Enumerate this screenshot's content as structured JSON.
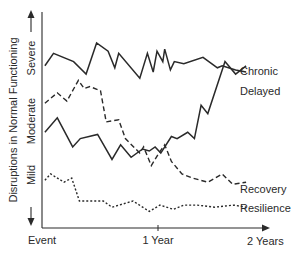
{
  "chart_data": {
    "type": "line",
    "title": "",
    "xlabel": "",
    "ylabel": "Disruptions in Normal Functioning",
    "x_ticks": [
      {
        "label": "Event",
        "value": 0
      },
      {
        "label": "1 Year",
        "value": 12
      },
      {
        "label": "2 Years",
        "value": 24
      }
    ],
    "y_levels": [
      {
        "label": "Mild",
        "value": 2.5
      },
      {
        "label": "Moderate",
        "value": 5.5
      },
      {
        "label": "Severe",
        "value": 8.5
      }
    ],
    "xlim": [
      0,
      24
    ],
    "ylim": [
      0,
      10
    ],
    "grid": false,
    "legend_position": "inline-right",
    "series": [
      {
        "name": "Chronic",
        "style": "solid",
        "x": [
          0.3,
          1.2,
          3.3,
          4.6,
          5.7,
          6.9,
          7.6,
          8.0,
          10.2,
          11.0,
          11.6,
          12.0,
          12.6,
          12.8,
          13.4,
          13.8,
          14.8,
          16.8,
          18.3,
          18.8,
          20.2,
          21.3
        ],
        "values": [
          7.8,
          8.4,
          8.0,
          7.4,
          8.9,
          8.5,
          7.7,
          8.4,
          7.2,
          8.4,
          7.5,
          8.5,
          8.0,
          8.6,
          7.6,
          8.0,
          7.9,
          8.2,
          7.7,
          7.8,
          7.6,
          7.5
        ]
      },
      {
        "name": "Delayed",
        "style": "solid",
        "x": [
          0.3,
          1.6,
          3.2,
          4.0,
          5.8,
          7.3,
          8.2,
          9.3,
          10.5,
          11.2,
          11.8,
          12.4,
          13.5,
          14.1,
          15.2,
          15.9,
          16.6,
          17.3,
          19.1,
          20.2,
          21.3
        ],
        "values": [
          4.6,
          5.3,
          3.9,
          4.3,
          4.5,
          3.3,
          4.0,
          3.4,
          3.8,
          3.7,
          3.9,
          3.6,
          4.4,
          4.3,
          4.6,
          4.3,
          5.9,
          5.5,
          8.0,
          7.4,
          7.8
        ]
      },
      {
        "name": "Recovery",
        "style": "dashed",
        "x": [
          0.3,
          1.6,
          2.6,
          3.8,
          4.4,
          5.0,
          6.1,
          6.7,
          8.0,
          8.7,
          10.2,
          10.6,
          11.4,
          12.2,
          12.8,
          13.5,
          14.6,
          15.7,
          17.3,
          18.8,
          19.9,
          21.3
        ],
        "values": [
          6.0,
          6.5,
          6.1,
          7.1,
          6.7,
          6.8,
          6.6,
          5.1,
          5.2,
          4.3,
          3.6,
          3.9,
          3.0,
          3.6,
          4.0,
          3.2,
          2.6,
          2.4,
          2.2,
          2.6,
          2.1,
          2.2
        ]
      },
      {
        "name": "Resilience",
        "style": "dotted",
        "x": [
          0.3,
          0.9,
          2.3,
          3.1,
          3.9,
          6.4,
          7.3,
          9.5,
          11.2,
          12.3,
          13.7,
          14.8,
          16.2,
          18.0,
          20.0,
          21.3
        ],
        "values": [
          2.3,
          2.6,
          2.2,
          2.4,
          1.3,
          1.3,
          1.0,
          1.3,
          0.8,
          1.1,
          0.9,
          1.1,
          1.1,
          1.0,
          1.1,
          1.0
        ]
      }
    ]
  },
  "axes": {
    "y_label": "Disruptions in Normal Functioning",
    "y_levels": [
      "Mild",
      "Moderate",
      "Severe"
    ],
    "x_labels": [
      "Event",
      "1 Year",
      "2 Years"
    ]
  },
  "legend": {
    "chronic": "Chronic",
    "delayed": "Delayed",
    "recovery": "Recovery",
    "resilience": "Resilience"
  },
  "colors": {
    "ink": "#2a2a2a",
    "background": "#ffffff"
  }
}
